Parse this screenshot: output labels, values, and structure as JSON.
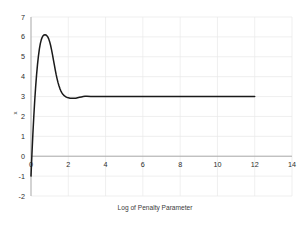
{
  "chart_data": {
    "type": "line",
    "title": "",
    "xlabel": "Log of Penalty Parameter",
    "ylabel": "x",
    "xlim": [
      0,
      14
    ],
    "ylim": [
      -2,
      7
    ],
    "xticks": [
      0,
      2,
      4,
      6,
      8,
      10,
      12,
      14
    ],
    "xtick_labels": [
      "0",
      "2",
      "4",
      "6",
      "8",
      "10",
      "12",
      "14"
    ],
    "yticks": [
      -2,
      -1,
      0,
      1,
      2,
      3,
      4,
      5,
      6,
      7
    ],
    "ytick_labels": [
      "-2",
      "-1",
      "0",
      "1",
      "2",
      "3",
      "4",
      "5",
      "6",
      "7"
    ],
    "grid": true,
    "legend": "none",
    "series": [
      {
        "name": "x vs log penalty parameter",
        "color": "#1a1a1a",
        "x": [
          0.0,
          0.05,
          0.1,
          0.15,
          0.2,
          0.25,
          0.3,
          0.35,
          0.4,
          0.45,
          0.5,
          0.55,
          0.6,
          0.65,
          0.7,
          0.75,
          0.8,
          0.85,
          0.9,
          0.95,
          1.0,
          1.05,
          1.1,
          1.15,
          1.2,
          1.25,
          1.3,
          1.35,
          1.4,
          1.45,
          1.5,
          1.55,
          1.6,
          1.65,
          1.7,
          1.75,
          1.8,
          1.85,
          1.9,
          1.95,
          2.0,
          2.1,
          2.2,
          2.3,
          2.4,
          2.5,
          2.6,
          2.7,
          2.8,
          2.9,
          3.0,
          3.2,
          3.4,
          3.6,
          3.8,
          4.0,
          5.0,
          6.0,
          7.0,
          8.0,
          9.0,
          10.0,
          11.0,
          12.0
        ],
        "y": [
          -1.0,
          0.1,
          1.1,
          2.0,
          2.8,
          3.5,
          4.1,
          4.62,
          5.05,
          5.4,
          5.66,
          5.85,
          5.98,
          6.06,
          6.1,
          6.11,
          6.1,
          6.06,
          6.0,
          5.9,
          5.76,
          5.58,
          5.36,
          5.12,
          4.86,
          4.6,
          4.34,
          4.1,
          3.89,
          3.7,
          3.54,
          3.4,
          3.29,
          3.2,
          3.13,
          3.07,
          3.03,
          3.0,
          2.97,
          2.95,
          2.94,
          2.92,
          2.91,
          2.91,
          2.92,
          2.94,
          2.96,
          2.98,
          3.0,
          3.01,
          3.01,
          3.0,
          3.0,
          3.0,
          3.0,
          3.0,
          3.0,
          3.0,
          3.0,
          3.0,
          3.0,
          3.0,
          3.0,
          3.0
        ]
      }
    ],
    "annotations": {
      "peak_x": 1.0,
      "peak_y": 6.1,
      "start_x": 0.0,
      "start_y": -1.0,
      "plateau_value": 3.0,
      "plateau_end_x": 12.0
    },
    "colors": {
      "line": "#1a1a1a",
      "grid": "#e8e8e8",
      "axis": "#a6a6a6",
      "text": "#2b2b2b",
      "background": "#ffffff"
    }
  }
}
